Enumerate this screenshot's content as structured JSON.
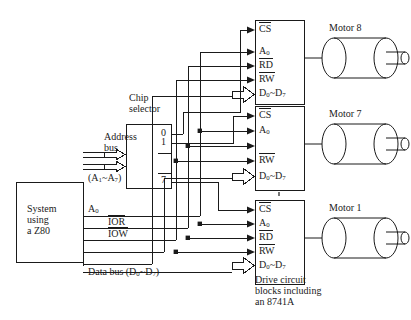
{
  "diagram": {
    "system_block": {
      "line1": "System",
      "line2": "using",
      "line3": "a Z80"
    },
    "chip_selector": {
      "title_line1": "Chip",
      "title_line2": "selector",
      "outputs": [
        "0",
        "1",
        "7"
      ]
    },
    "buses": {
      "address_bus_line1": "Address",
      "address_bus_line2": "bus",
      "address_range": "(A",
      "address_range_sub1": "1",
      "address_range_mid": "~A",
      "address_range_sub2": "7",
      "address_range_end": ")",
      "a0": "A",
      "a0_sub": "0",
      "ior": "IOR",
      "iow": "IOW",
      "data_bus": "Data bus (D",
      "data_bus_sub1": "0",
      "data_bus_mid": "~D",
      "data_bus_sub2": "7",
      "data_bus_end": ")"
    },
    "drive_blocks": [
      {
        "id": "block-8",
        "pins": [
          "CS",
          "A0",
          "RD",
          "RW",
          "D0~D7"
        ],
        "pin_cs": "CS",
        "pin_a0": "A",
        "pin_a0_sub": "0",
        "pin_rd": "RD",
        "pin_rw": "RW",
        "pin_d_start": "D",
        "pin_d_sub1": "0",
        "pin_d_mid": "~D",
        "pin_d_sub2": "7",
        "motor_label": "Motor 8"
      },
      {
        "id": "block-7",
        "pin_cs": "CS",
        "pin_a0": "A",
        "pin_a0_sub": "0",
        "pin_rd": "",
        "pin_rw": "RW",
        "pin_d_start": "D",
        "pin_d_sub1": "0",
        "pin_d_mid": "~D",
        "pin_d_sub2": "7",
        "motor_label": "Motor 7"
      },
      {
        "id": "block-1",
        "pin_cs": "CS",
        "pin_a0": "A",
        "pin_a0_sub": "0",
        "pin_rd": "RD",
        "pin_rw": "RW",
        "pin_d_start": "D",
        "pin_d_sub1": "0",
        "pin_d_mid": "~D",
        "pin_d_sub2": "7",
        "motor_label": "Motor 1"
      }
    ],
    "caption": {
      "line1": "Drive circuit",
      "line2": "blocks including",
      "line3": "an 8741A"
    },
    "colors": {
      "stroke": "#1a1a1a",
      "background": "#ffffff"
    }
  }
}
